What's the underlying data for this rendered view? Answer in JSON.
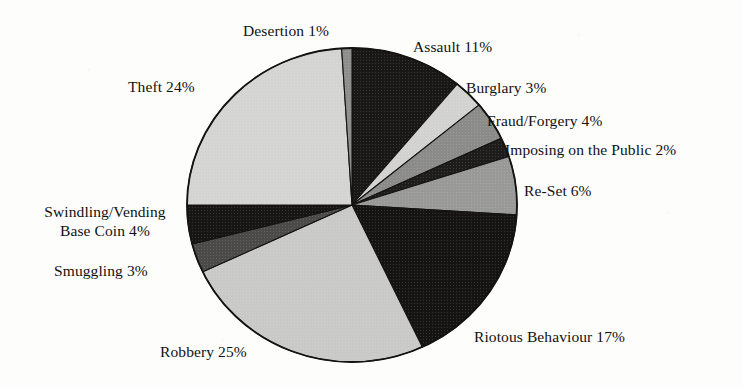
{
  "chart_data": {
    "type": "pie",
    "title": "",
    "subtitle": "",
    "xlabel": "",
    "ylabel": "",
    "legend_position": "none",
    "grid": false,
    "units": "percent",
    "total": 100,
    "categories": [
      "Assault",
      "Burglary",
      "Fraud/Forgery",
      "Imposing on the Public",
      "Re-Set",
      "Riotous Behaviour",
      "Robbery",
      "Smuggling",
      "Swindling/Vending Base Coin",
      "Theft",
      "Desertion"
    ],
    "values": [
      11,
      3,
      4,
      2,
      6,
      17,
      25,
      3,
      4,
      24,
      1
    ],
    "slices": [
      {
        "id": "assault",
        "label": "Assault",
        "value": 11,
        "value_text": "11%",
        "label_text": "Assault 11%",
        "color": "#1a1817",
        "start_angle": 0,
        "end_angle": 39.6
      },
      {
        "id": "burglary",
        "label": "Burglary",
        "value": 3,
        "value_text": "3%",
        "label_text": "Burglary 3%",
        "color": "#d2d2d0",
        "start_angle": 39.6,
        "end_angle": 50.4
      },
      {
        "id": "fraud-forgery",
        "label": "Fraud/Forgery",
        "value": 4,
        "value_text": "4%",
        "label_text": "Fraud/Forgery 4%",
        "color": "#8b8b89",
        "start_angle": 50.4,
        "end_angle": 64.8
      },
      {
        "id": "imposing-on-the-public",
        "label": "Imposing on the Public",
        "value": 2,
        "value_text": "2%",
        "label_text": "Imposing on the Public 2%",
        "color": "#1f1d1c",
        "start_angle": 64.8,
        "end_angle": 72.0
      },
      {
        "id": "re-set",
        "label": "Re-Set",
        "value": 6,
        "value_text": "6%",
        "label_text": "Re-Set 6%",
        "color": "#999997",
        "start_angle": 72.0,
        "end_angle": 93.6
      },
      {
        "id": "riotous-behaviour",
        "label": "Riotous Behaviour",
        "value": 17,
        "value_text": "17%",
        "label_text": "Riotous Behaviour 17%",
        "color": "#151413",
        "start_angle": 93.6,
        "end_angle": 154.8
      },
      {
        "id": "robbery",
        "label": "Robbery",
        "value": 25,
        "value_text": "25%",
        "label_text": "Robbery 25%",
        "color": "#c9c9c7",
        "start_angle": 154.8,
        "end_angle": 244.8
      },
      {
        "id": "smuggling",
        "label": "Smuggling",
        "value": 3,
        "value_text": "3%",
        "label_text": "Smuggling 3%",
        "color": "#4c4a49",
        "start_angle": 244.8,
        "end_angle": 255.6
      },
      {
        "id": "swindling-vending-base-coin",
        "label": "Swindling/Vending Base Coin",
        "value": 4,
        "value_text": "4%",
        "label_line1": "Swindling/Vending",
        "label_line2": "Base Coin 4%",
        "label_text": "Swindling/Vending Base Coin 4%",
        "color": "#171615",
        "start_angle": 255.6,
        "end_angle": 270.0
      },
      {
        "id": "theft",
        "label": "Theft",
        "value": 24,
        "value_text": "24%",
        "label_text": "Theft 24%",
        "color": "#d4d4d2",
        "start_angle": 270.0,
        "end_angle": 356.4
      },
      {
        "id": "desertion",
        "label": "Desertion",
        "value": 1,
        "value_text": "1%",
        "label_text": "Desertion 1%",
        "color": "#8e8e8c",
        "start_angle": 356.4,
        "end_angle": 360.0
      }
    ]
  },
  "geometry": {
    "center_x": 352,
    "center_y": 205,
    "radius_x": 165,
    "radius_y": 157,
    "outline_color": "#141312",
    "background_color": "#fdfdfc"
  }
}
